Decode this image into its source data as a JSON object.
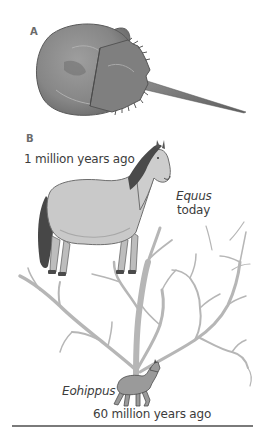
{
  "figure": {
    "panel_a": {
      "label": "A",
      "subject": "horseshoe-crab"
    },
    "panel_b": {
      "label": "B",
      "top_caption": "1 million years ago",
      "modern_species": "Equus",
      "modern_time": "today",
      "ancestor_species": "Eohippus",
      "bottom_caption": "60 million years ago",
      "subject": "horse-evolution-branching-tree"
    }
  },
  "colors": {
    "crab_shell": "#8a8a8a",
    "tree_branches": "#b4b4b4",
    "horse_body": "#c9c9c9",
    "horse_mane": "#4a4a4a",
    "rule": "#7a7a7a"
  }
}
